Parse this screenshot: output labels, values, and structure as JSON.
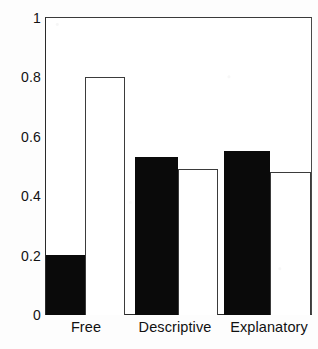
{
  "chart_data": {
    "type": "bar",
    "title": "",
    "subtitle": "",
    "xlabel": "",
    "ylabel": "",
    "categories": [
      "Free",
      "Descriptive",
      "Explanatory"
    ],
    "series": [
      {
        "name": "filled",
        "style": "solid-black",
        "color": "#0a0a0a",
        "values": [
          0.2,
          0.53,
          0.55
        ]
      },
      {
        "name": "hollow",
        "style": "outline-white",
        "color": "#ffffff",
        "values": [
          0.8,
          0.49,
          0.48
        ]
      }
    ],
    "ylim": [
      0,
      1
    ],
    "y_ticks": [
      0,
      0.2,
      0.4,
      0.6,
      0.8,
      1
    ],
    "y_tick_labels": [
      "0",
      "0.2",
      "0.4",
      "0.6",
      "0.8",
      "1"
    ],
    "grid": false,
    "legend": "none",
    "frame": "box"
  },
  "axis": {
    "y_labels": [
      "1",
      "0.8",
      "0.6",
      "0.4",
      "0.2",
      "0"
    ],
    "x_labels": [
      "Free",
      "Descriptive",
      "Explanatory"
    ]
  },
  "colors": {
    "bar_filled": "#0a0a0a",
    "bar_hollow_fill": "#ffffff",
    "bar_hollow_stroke": "#3b3b3b",
    "frame": "#2a2a2a",
    "text": "#111111",
    "background": "#fdfdfd"
  }
}
